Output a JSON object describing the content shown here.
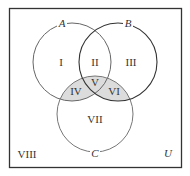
{
  "diagram": {
    "type": "venn-3-set",
    "universe": {
      "label": "U",
      "border_color": "#333333"
    },
    "sets": [
      {
        "id": "A",
        "label": "A",
        "cx": 72,
        "cy": 62,
        "r": 39,
        "stroke": "#666666"
      },
      {
        "id": "B",
        "label": "B",
        "cx": 118,
        "cy": 62,
        "r": 39,
        "stroke": "#333333"
      },
      {
        "id": "C",
        "label": "C",
        "cx": 95,
        "cy": 114,
        "r": 38,
        "stroke": "#777777"
      }
    ],
    "regions": [
      {
        "id": "I",
        "label": "I",
        "description": "A only",
        "shaded": false
      },
      {
        "id": "II",
        "label": "II",
        "description": "A and B only",
        "shaded": false
      },
      {
        "id": "III",
        "label": "III",
        "description": "B only",
        "shaded": false
      },
      {
        "id": "IV",
        "label": "IV",
        "description": "A and C only",
        "shaded": true
      },
      {
        "id": "V",
        "label": "V",
        "description": "A, B and C",
        "shaded": true
      },
      {
        "id": "VI",
        "label": "VI",
        "description": "B and C only",
        "shaded": true
      },
      {
        "id": "VII",
        "label": "VII",
        "description": "C only",
        "shaded": false
      },
      {
        "id": "VIII",
        "label": "VIII",
        "description": "outside A, B and C",
        "shaded": false
      }
    ],
    "shade_color": "#dcdcdc"
  }
}
